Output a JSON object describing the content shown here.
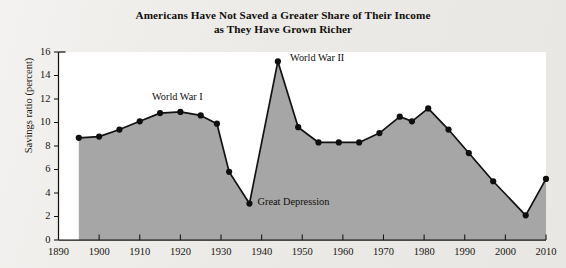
{
  "figure": {
    "title_line1": "Americans Have Not Saved a Greater Share of Their Income",
    "title_line2": "as They Have Grown Richer",
    "ylabel": "Savings ratio (percent)",
    "area_color": "#a6a6a6",
    "line_color": "#121110",
    "background_color": "#efeeec",
    "plot_background_color": "#ffffff"
  },
  "chart_data": {
    "type": "line",
    "title": "Americans Have Not Saved a Greater Share of Their Income as They Have Grown Richer",
    "xlabel": "",
    "ylabel": "Savings ratio (percent)",
    "xlim": [
      1890,
      2010
    ],
    "ylim": [
      0,
      16
    ],
    "grid": false,
    "legend": "none",
    "filled_area": true,
    "markers": true,
    "ytick_values": [
      0,
      2,
      4,
      6,
      8,
      10,
      12,
      14,
      16
    ],
    "ytick_labels": [
      "0",
      "2",
      "4",
      "6",
      "8",
      "10",
      "12",
      "14",
      "16"
    ],
    "xtick_values": [
      1890,
      1900,
      1910,
      1920,
      1930,
      1940,
      1950,
      1960,
      1970,
      1980,
      1990,
      2000,
      2010
    ],
    "xtick_labels": [
      "1890",
      "1900",
      "1910",
      "1920",
      "1930",
      "1940",
      "1950",
      "1960",
      "1970",
      "1980",
      "1990",
      "2000",
      "2010"
    ],
    "x": [
      1895,
      1900,
      1905,
      1910,
      1915,
      1920,
      1925,
      1929,
      1932,
      1937,
      1944,
      1949,
      1954,
      1959,
      1964,
      1969,
      1974,
      1977,
      1981,
      1986,
      1991,
      1997,
      2005,
      2010
    ],
    "values": [
      8.7,
      8.8,
      9.4,
      10.1,
      10.8,
      10.9,
      10.6,
      9.9,
      5.8,
      3.1,
      15.2,
      9.6,
      8.3,
      8.3,
      8.3,
      9.1,
      10.5,
      10.1,
      11.2,
      9.4,
      7.4,
      5.0,
      2.1,
      5.2
    ],
    "annotations": [
      {
        "text": "World War I",
        "x": 1913,
        "y": 11.9
      },
      {
        "text": "World War II",
        "x": 1947,
        "y": 15.2
      },
      {
        "text": "Great Depression",
        "x": 1939,
        "y": 3.0
      }
    ]
  }
}
